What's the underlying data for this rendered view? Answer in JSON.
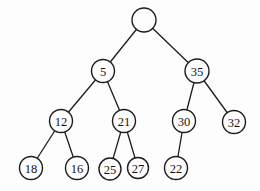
{
  "diagram": {
    "type": "binary-tree",
    "background": "#fdfdfd",
    "stroke_color": "#1c1c1c",
    "node_fill": "#fdfdfd",
    "text_color": "#141414",
    "edge_width": 1.3,
    "circle_width": 1.4,
    "nodes": [
      {
        "id": "root",
        "label": "",
        "x": 144,
        "y": 20,
        "r": 12
      },
      {
        "id": "n5",
        "label": "5",
        "x": 103,
        "y": 71,
        "r": 11.5
      },
      {
        "id": "n35",
        "label": "35",
        "x": 197,
        "y": 71,
        "r": 12
      },
      {
        "id": "n12",
        "label": "12",
        "x": 61,
        "y": 121,
        "r": 11.5
      },
      {
        "id": "n21",
        "label": "21",
        "x": 124,
        "y": 121,
        "r": 11.5
      },
      {
        "id": "n30",
        "label": "30",
        "x": 184,
        "y": 121,
        "r": 11.5
      },
      {
        "id": "n32",
        "label": "32",
        "x": 234,
        "y": 122,
        "r": 11.5
      },
      {
        "id": "n18",
        "label": "18",
        "x": 31,
        "y": 168,
        "r": 11.5
      },
      {
        "id": "n16",
        "label": "16",
        "x": 77,
        "y": 168,
        "r": 11.5
      },
      {
        "id": "n25",
        "label": "25",
        "x": 110,
        "y": 169,
        "r": 11
      },
      {
        "id": "n27",
        "label": "27",
        "x": 138,
        "y": 168,
        "r": 10.5
      },
      {
        "id": "n22",
        "label": "22",
        "x": 176,
        "y": 168,
        "r": 11.5
      }
    ],
    "edges": [
      {
        "from": "root",
        "to": "n5"
      },
      {
        "from": "root",
        "to": "n35"
      },
      {
        "from": "n5",
        "to": "n12"
      },
      {
        "from": "n5",
        "to": "n21"
      },
      {
        "from": "n35",
        "to": "n30"
      },
      {
        "from": "n35",
        "to": "n32"
      },
      {
        "from": "n12",
        "to": "n18"
      },
      {
        "from": "n12",
        "to": "n16"
      },
      {
        "from": "n21",
        "to": "n25"
      },
      {
        "from": "n21",
        "to": "n27"
      },
      {
        "from": "n30",
        "to": "n22"
      }
    ]
  }
}
